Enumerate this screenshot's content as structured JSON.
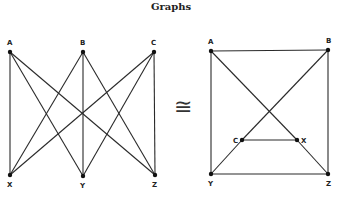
{
  "title": "Graphs",
  "isomorphism_symbol": "≅",
  "left_graph": {
    "name": "K3,3 bipartite drawing",
    "nodes": [
      {
        "id": "A",
        "x": 10,
        "y": 52,
        "lx": 7,
        "ly": 45
      },
      {
        "id": "B",
        "x": 83,
        "y": 52,
        "lx": 80,
        "ly": 45
      },
      {
        "id": "C",
        "x": 154,
        "y": 52,
        "lx": 151,
        "ly": 45
      },
      {
        "id": "X",
        "x": 10,
        "y": 175,
        "lx": 7,
        "ly": 187
      },
      {
        "id": "Y",
        "x": 83,
        "y": 176,
        "lx": 80,
        "ly": 188
      },
      {
        "id": "Z",
        "x": 155,
        "y": 175,
        "lx": 152,
        "ly": 187
      }
    ],
    "edges": [
      [
        "A",
        "X"
      ],
      [
        "A",
        "Y"
      ],
      [
        "A",
        "Z"
      ],
      [
        "B",
        "X"
      ],
      [
        "B",
        "Y"
      ],
      [
        "B",
        "Z"
      ],
      [
        "C",
        "X"
      ],
      [
        "C",
        "Y"
      ],
      [
        "C",
        "Z"
      ]
    ]
  },
  "right_graph": {
    "name": "K3,3 square drawing",
    "nodes": [
      {
        "id": "A",
        "x": 211,
        "y": 51,
        "lx": 208,
        "ly": 44
      },
      {
        "id": "B",
        "x": 328,
        "y": 50,
        "lx": 326,
        "ly": 43
      },
      {
        "id": "C",
        "x": 242,
        "y": 140,
        "lx": 233,
        "ly": 143
      },
      {
        "id": "X",
        "x": 297,
        "y": 140,
        "lx": 301,
        "ly": 143
      },
      {
        "id": "Y",
        "x": 211,
        "y": 174,
        "lx": 208,
        "ly": 186
      },
      {
        "id": "Z",
        "x": 328,
        "y": 174,
        "lx": 326,
        "ly": 186
      }
    ],
    "edges": [
      [
        "A",
        "B"
      ],
      [
        "A",
        "Y"
      ],
      [
        "B",
        "Z"
      ],
      [
        "Y",
        "Z"
      ],
      [
        "A",
        "X"
      ],
      [
        "X",
        "Z"
      ],
      [
        "B",
        "C"
      ],
      [
        "C",
        "Y"
      ],
      [
        "C",
        "X"
      ]
    ]
  }
}
